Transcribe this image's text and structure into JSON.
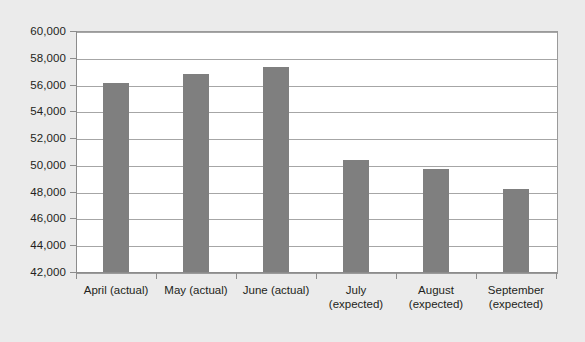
{
  "chart_data": {
    "type": "bar",
    "title": "",
    "xlabel": "",
    "ylabel": "",
    "categories": [
      "April (actual)",
      "May (actual)",
      "June (actual)",
      "July (expected)",
      "August (expected)",
      "September (expected)"
    ],
    "category_lines": [
      [
        "April (actual)"
      ],
      [
        "May (actual)"
      ],
      [
        "June (actual)"
      ],
      [
        "July",
        "(expected)"
      ],
      [
        "August",
        "(expected)"
      ],
      [
        "September",
        "(expected)"
      ]
    ],
    "values": [
      56100,
      56800,
      57300,
      50400,
      49700,
      48200
    ],
    "ylim": [
      42000,
      60000
    ],
    "ytick_labels": [
      "60,000",
      "58,000",
      "56,000",
      "54,000",
      "52,000",
      "50,000",
      "48,000",
      "46,000",
      "44,000",
      "42,000"
    ],
    "ytick_values": [
      60000,
      58000,
      56000,
      54000,
      52000,
      50000,
      48000,
      46000,
      44000,
      42000
    ],
    "grid": true,
    "legend": "none",
    "bar_color": "#7f7f7f",
    "plot_background": "#ffffff",
    "figure_background": "#ebebeb",
    "gridline_color": "#a6a6a6",
    "axis_color": "#8c8c8c",
    "text_color": "#231f20"
  }
}
